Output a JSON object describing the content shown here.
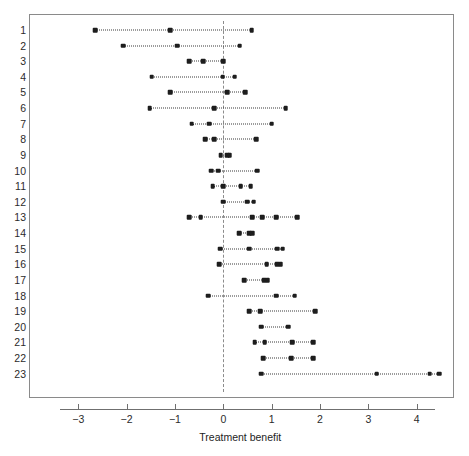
{
  "chart_data": {
    "type": "scatter",
    "title": "",
    "xlabel": "Treatment benefit",
    "ylabel": "",
    "xlim": [
      -3.9,
      4.9
    ],
    "xticks": [
      -3,
      -2,
      -1,
      0,
      1,
      2,
      3,
      4
    ],
    "xtick_labels": [
      "−3",
      "−2",
      "−1",
      "0",
      "1",
      "2",
      "3",
      "4"
    ],
    "grid": false,
    "legend": null,
    "reference_line": {
      "x": 0,
      "style": "dashed",
      "color": "#8c8c8c"
    },
    "point_color": "#1d1d1d",
    "line_style": "dotted",
    "ytick_labels": [
      "1",
      "2",
      "3",
      "4",
      "5",
      "6",
      "7",
      "8",
      "9",
      "10",
      "11",
      "12",
      "13",
      "14",
      "15",
      "16",
      "17",
      "18",
      "19",
      "20",
      "21",
      "22",
      "23"
    ],
    "rows": [
      {
        "label": "1",
        "values": [
          -2.65,
          -1.1,
          0.59
        ]
      },
      {
        "label": "2",
        "values": [
          -2.07,
          -0.95,
          0.34
        ]
      },
      {
        "label": "3",
        "values": [
          -0.7,
          -0.41,
          0.0
        ]
      },
      {
        "label": "4",
        "values": [
          -1.48,
          -0.01,
          0.24
        ]
      },
      {
        "label": "5",
        "values": [
          -1.1,
          0.08,
          0.45
        ]
      },
      {
        "label": "6",
        "values": [
          -1.52,
          -0.19,
          1.29
        ]
      },
      {
        "label": "7",
        "values": [
          -0.65,
          -0.29,
          1.0
        ]
      },
      {
        "label": "8",
        "values": [
          -0.38,
          -0.19,
          0.68
        ]
      },
      {
        "label": "9",
        "values": [
          -0.05,
          0.08,
          0.13
        ]
      },
      {
        "label": "10",
        "values": [
          -0.25,
          -0.1,
          0.7
        ]
      },
      {
        "label": "11",
        "values": [
          -0.22,
          0.0,
          0.36,
          0.57
        ]
      },
      {
        "label": "12",
        "values": [
          0.0,
          0.5,
          0.63
        ]
      },
      {
        "label": "13",
        "values": [
          -0.7,
          -0.47,
          0.6,
          0.81,
          1.1,
          1.53
        ]
      },
      {
        "label": "14",
        "values": [
          0.33,
          0.54,
          0.6
        ]
      },
      {
        "label": "15",
        "values": [
          -0.07,
          0.54,
          1.12,
          1.23
        ]
      },
      {
        "label": "16",
        "values": [
          -0.08,
          0.9,
          1.12,
          1.19
        ]
      },
      {
        "label": "17",
        "values": [
          0.43,
          0.85,
          0.92
        ]
      },
      {
        "label": "18",
        "values": [
          -0.31,
          1.09,
          1.48
        ]
      },
      {
        "label": "19",
        "values": [
          0.54,
          0.76,
          1.9
        ]
      },
      {
        "label": "20",
        "values": [
          0.79,
          1.34
        ]
      },
      {
        "label": "21",
        "values": [
          0.65,
          0.86,
          1.43,
          1.86
        ]
      },
      {
        "label": "22",
        "values": [
          0.83,
          1.41,
          1.86
        ]
      },
      {
        "label": "23",
        "values": [
          0.79,
          3.17,
          4.27,
          4.46
        ]
      }
    ]
  }
}
